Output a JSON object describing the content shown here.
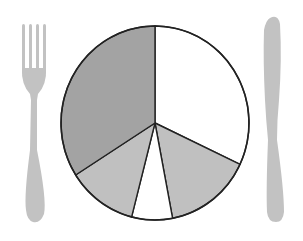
{
  "colors": {
    "background": "#ffffff",
    "utensil": "#c2c2c2",
    "slice_dark": "#a3a3a3",
    "slice_light": "#c0c0c0",
    "slice_white": "#ffffff",
    "outline": "#222222"
  },
  "chart_data": {
    "type": "pie",
    "title": "",
    "style": "plate pie chart flanked by fork (left) and knife (right), no labels",
    "start_angle_deg": 0,
    "direction": "clockwise",
    "slices": [
      {
        "label": "",
        "value": 32,
        "fill": "white"
      },
      {
        "label": "",
        "value": 15,
        "fill": "light-gray"
      },
      {
        "label": "",
        "value": 7,
        "fill": "white"
      },
      {
        "label": "",
        "value": 12,
        "fill": "light-gray"
      },
      {
        "label": "",
        "value": 34,
        "fill": "dark-gray"
      }
    ],
    "values": [
      32,
      15,
      7,
      12,
      34
    ],
    "legend": "none",
    "labels_visible": false
  }
}
